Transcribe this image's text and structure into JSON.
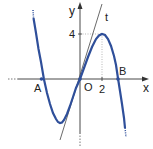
{
  "diagram": {
    "function": "y = -x^3/4 + 3x",
    "tangent": "t: y = 3x (tangent at O)",
    "labels": {
      "x_axis": "x",
      "y_axis": "y",
      "origin": "O",
      "point_a": "A",
      "point_b": "B",
      "tangent": "t",
      "x_tick": "2",
      "y_tick": "4"
    },
    "points": {
      "A": [
        -3.46,
        0
      ],
      "O": [
        0,
        0
      ],
      "B": [
        3.46,
        0
      ],
      "max": [
        2,
        4
      ],
      "min": [
        -2,
        -4
      ]
    },
    "colors": {
      "curve": "#2f4f9a",
      "axes": "#333333",
      "tangent": "#444444"
    }
  }
}
